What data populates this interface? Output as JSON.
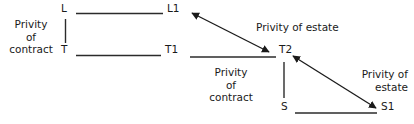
{
  "diagram": {
    "nodes": [
      {
        "id": "L",
        "label": "L"
      },
      {
        "id": "L1",
        "label": "L1"
      },
      {
        "id": "T",
        "label": "T"
      },
      {
        "id": "T1",
        "label": "T1"
      },
      {
        "id": "T2",
        "label": "T2"
      },
      {
        "id": "S",
        "label": "S"
      },
      {
        "id": "S1",
        "label": "S1"
      }
    ],
    "relation_labels": [
      {
        "id": "contract-left",
        "lines": [
          "Privity",
          "of",
          "contract"
        ]
      },
      {
        "id": "estate-top",
        "lines": [
          "Privity of estate"
        ]
      },
      {
        "id": "contract-mid",
        "lines": [
          "Privity",
          "of",
          "contract"
        ]
      },
      {
        "id": "estate-right",
        "lines": [
          "Privity of",
          "estate"
        ]
      }
    ],
    "colors": {
      "ink": "#1a1a1a",
      "line": "#2b2b2b",
      "background": "#ffffff"
    }
  }
}
